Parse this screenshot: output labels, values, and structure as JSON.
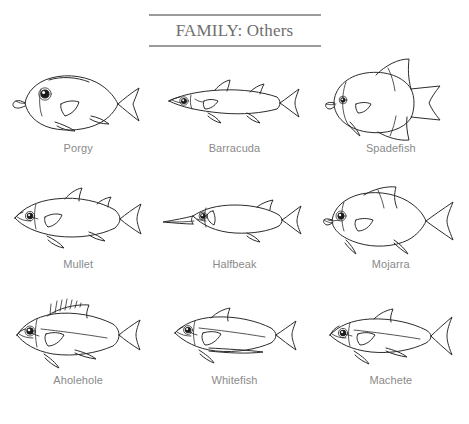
{
  "header": {
    "title": "FAMILY: Others",
    "rule_color": "#9b9b9b",
    "title_color": "#6e6e6e"
  },
  "theme": {
    "background": "#ffffff",
    "line_color": "#2b2b2b",
    "caption_color": "#8a8a8a"
  },
  "grid": {
    "columns": 3,
    "rows": 3,
    "items": [
      {
        "label": "Porgy",
        "icon": "porgy-fish-illustration",
        "shape": "deep-bodied",
        "row": 1,
        "col": 1
      },
      {
        "label": "Barracuda",
        "icon": "barracuda-fish-illustration",
        "shape": "elongated",
        "row": 1,
        "col": 2
      },
      {
        "label": "Spadefish",
        "icon": "spadefish-fish-illustration",
        "shape": "disc-shaped",
        "row": 1,
        "col": 3
      },
      {
        "label": "Mullet",
        "icon": "mullet-fish-illustration",
        "shape": "streamlined",
        "row": 2,
        "col": 1
      },
      {
        "label": "Halfbeak",
        "icon": "halfbeak-fish-illustration",
        "shape": "needle-jaw",
        "row": 2,
        "col": 2
      },
      {
        "label": "Mojarra",
        "icon": "mojarra-fish-illustration",
        "shape": "oval-deep",
        "row": 2,
        "col": 3
      },
      {
        "label": "Aholehole",
        "icon": "aholehole-fish-illustration",
        "shape": "spiny-dorsal",
        "row": 3,
        "col": 1
      },
      {
        "label": "Whitefish",
        "icon": "whitefish-fish-illustration",
        "shape": "moderate",
        "row": 3,
        "col": 2
      },
      {
        "label": "Machete",
        "icon": "machete-fish-illustration",
        "shape": "herring-like",
        "row": 3,
        "col": 3
      }
    ]
  }
}
